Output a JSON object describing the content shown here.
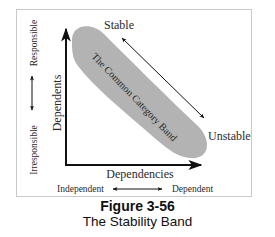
{
  "figure": {
    "number_label": "Figure 3-56",
    "title": "The Stability Band"
  },
  "diagram": {
    "y_axis_label": "Dependents",
    "x_axis_label": "Dependencies",
    "band_label": "The Common Category Band",
    "diagonal_top_label": "Stable",
    "diagonal_bottom_label": "Unstable",
    "left_scale": {
      "top_label": "Responsible",
      "bottom_label": "Irresponsible"
    },
    "bottom_scale": {
      "left_label": "Independent",
      "right_label": "Dependent"
    },
    "colors": {
      "band": "#b3b3b3",
      "lines": "#111111",
      "frame": "#c9c9c9"
    }
  }
}
